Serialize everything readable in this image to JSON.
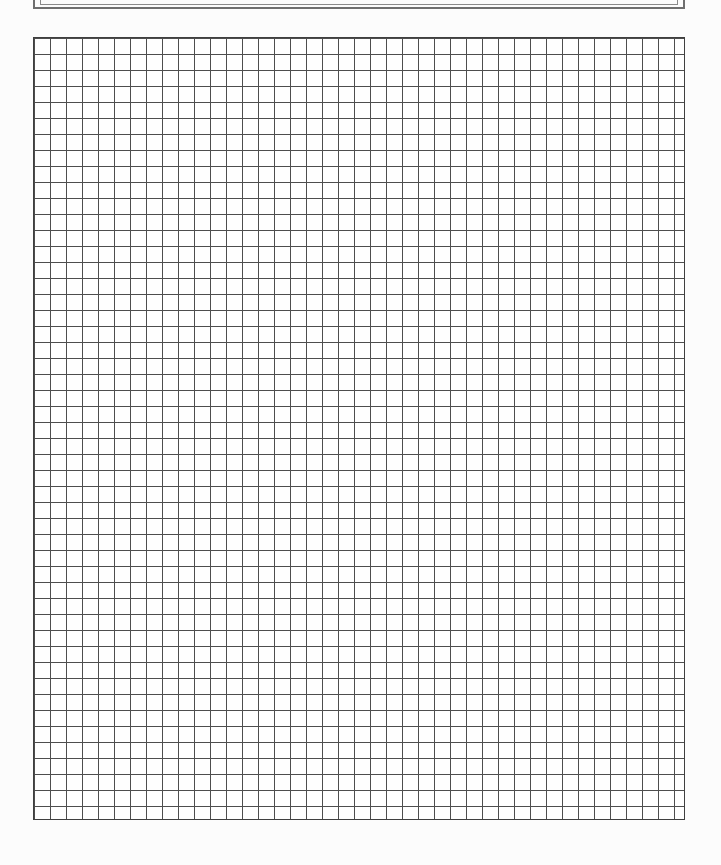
{
  "page": {
    "background_color": "#fcfcfc"
  },
  "header_box": {
    "value": "",
    "outer_border_color": "#6f6f6f",
    "inner_border_color": "#8a8a8a"
  },
  "grid": {
    "columns": 41,
    "rows": 49,
    "cell_size_px": 16,
    "line_color": "#4d4d4d",
    "outer_border_color": "#3f3f3f",
    "paper_color": "#fefefe"
  }
}
